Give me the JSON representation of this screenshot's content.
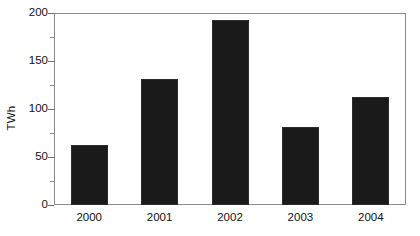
{
  "chart_data": {
    "type": "bar",
    "title": "",
    "xlabel": "",
    "ylabel": "TWh",
    "categories": [
      "2000",
      "2001",
      "2002",
      "2003",
      "2004"
    ],
    "values": [
      63,
      131,
      193,
      81,
      113
    ],
    "ylim": [
      0,
      200
    ],
    "y_ticks": [
      0,
      50,
      100,
      150,
      200
    ],
    "y_tick_labels": [
      "0",
      "50",
      "100",
      "150",
      "200"
    ],
    "y_minor_ticks": [
      25,
      75,
      125,
      175
    ],
    "grid": false,
    "legend": null,
    "bar_color": "#1a1a1a",
    "frame_color": "#8a8a8a",
    "background_color": "#ffffff"
  },
  "axes": {
    "y_title": "TWh"
  }
}
